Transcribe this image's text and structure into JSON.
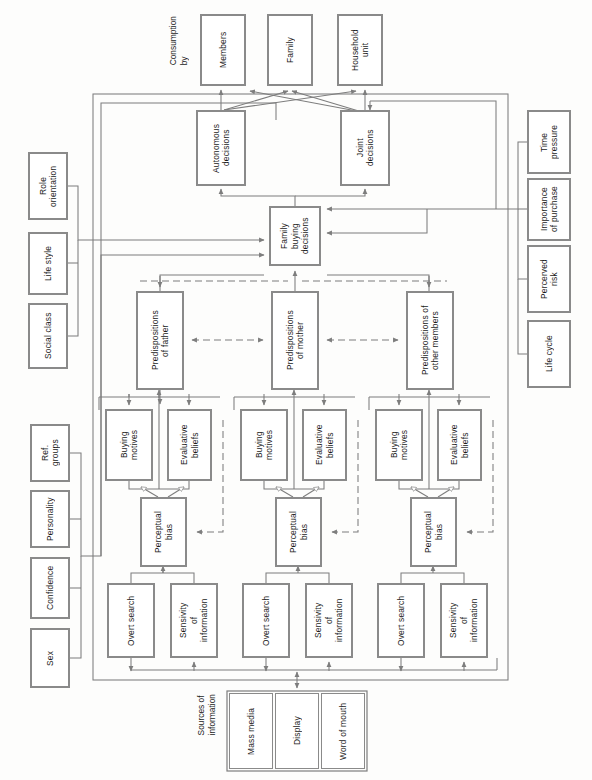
{
  "diagram": {
    "orientation": "rotated-90-ccw",
    "colors": {
      "box_border": "#8a8a8a",
      "box_fill": "#ffffff",
      "line": "#7d7d7d",
      "text": "#1b1b1b",
      "background": "#fdfdfc"
    },
    "free_labels": [
      {
        "id": "consumption-by",
        "text": "Consumption\nby",
        "x": 168,
        "y": 16
      },
      {
        "id": "sources-of-information",
        "text": "Sources of\ninformation",
        "x": 196,
        "y": 694
      }
    ],
    "boxes": [
      {
        "id": "members",
        "text": "Members",
        "x": 200,
        "y": 14,
        "w": 46,
        "h": 72
      },
      {
        "id": "family",
        "text": "Family",
        "x": 267,
        "y": 14,
        "w": 46,
        "h": 72
      },
      {
        "id": "household-unit",
        "text": "Household\nunit",
        "x": 337,
        "y": 14,
        "w": 46,
        "h": 72
      },
      {
        "id": "autonomous-decisions",
        "text": "Autonomous\ndecisions",
        "x": 196,
        "y": 110,
        "w": 50,
        "h": 76
      },
      {
        "id": "joint-decisions",
        "text": "Joint\ndecisions",
        "x": 340,
        "y": 110,
        "w": 50,
        "h": 76
      },
      {
        "id": "family-buying-decisions",
        "text": "Family\nbuying\ndecisions",
        "x": 269,
        "y": 206,
        "w": 52,
        "h": 60
      },
      {
        "id": "predispositions-father",
        "text": "Predispositions\nof father",
        "x": 136,
        "y": 291,
        "w": 48,
        "h": 99
      },
      {
        "id": "predispositions-mother",
        "text": "Predispositions\nof mother",
        "x": 271,
        "y": 291,
        "w": 48,
        "h": 99
      },
      {
        "id": "predispositions-other-members",
        "text": "Predispositions of\nother members",
        "x": 406,
        "y": 291,
        "w": 48,
        "h": 99
      },
      {
        "id": "buying-motives-father",
        "text": "Buying\nmotives",
        "x": 105,
        "y": 409,
        "w": 48,
        "h": 72
      },
      {
        "id": "evaluative-beliefs-father",
        "text": "Evaluative\nbeliefs",
        "x": 167,
        "y": 409,
        "w": 45,
        "h": 72
      },
      {
        "id": "perceptual-bias-father",
        "text": "Perceptual\nbias",
        "x": 140,
        "y": 497,
        "w": 47,
        "h": 70
      },
      {
        "id": "overt-search-father",
        "text": "Overt search",
        "x": 107,
        "y": 583,
        "w": 48,
        "h": 75
      },
      {
        "id": "sensivity-information-father",
        "text": "Sensivity\nof\ninformation",
        "x": 170,
        "y": 583,
        "w": 48,
        "h": 75
      },
      {
        "id": "buying-motives-mother",
        "text": "Buying\nmotives",
        "x": 240,
        "y": 409,
        "w": 48,
        "h": 72
      },
      {
        "id": "evaluative-beliefs-mother",
        "text": "Evaluative\nbeliefs",
        "x": 302,
        "y": 409,
        "w": 45,
        "h": 72
      },
      {
        "id": "perceptual-bias-mother",
        "text": "Perceptual\nbias",
        "x": 275,
        "y": 497,
        "w": 47,
        "h": 70
      },
      {
        "id": "overt-search-mother",
        "text": "Overt search",
        "x": 242,
        "y": 583,
        "w": 48,
        "h": 75
      },
      {
        "id": "sensivity-information-mother",
        "text": "Sensivity\nof\ninformation",
        "x": 305,
        "y": 583,
        "w": 48,
        "h": 75
      },
      {
        "id": "buying-motives-other",
        "text": "Buying\nmotives",
        "x": 375,
        "y": 409,
        "w": 48,
        "h": 72
      },
      {
        "id": "evaluative-beliefs-other",
        "text": "Evaluative\nbeliefs",
        "x": 437,
        "y": 409,
        "w": 45,
        "h": 72
      },
      {
        "id": "perceptual-bias-other",
        "text": "Perceptual\nbias",
        "x": 410,
        "y": 497,
        "w": 47,
        "h": 70
      },
      {
        "id": "overt-search-other",
        "text": "Overt search",
        "x": 377,
        "y": 583,
        "w": 48,
        "h": 75
      },
      {
        "id": "sensivity-information-other",
        "text": "Sensivity\nof\ninformation",
        "x": 440,
        "y": 583,
        "w": 48,
        "h": 75
      },
      {
        "id": "role-orientation",
        "text": "Role\norientation",
        "x": 28,
        "y": 152,
        "w": 40,
        "h": 68
      },
      {
        "id": "life-style",
        "text": "Life style",
        "x": 28,
        "y": 232,
        "w": 40,
        "h": 63
      },
      {
        "id": "social-class",
        "text": "Social class",
        "x": 28,
        "y": 303,
        "w": 40,
        "h": 66
      },
      {
        "id": "ref-groups",
        "text": "Ref.\ngroups",
        "x": 30,
        "y": 424,
        "w": 40,
        "h": 58
      },
      {
        "id": "personality",
        "text": "Personality",
        "x": 30,
        "y": 490,
        "w": 40,
        "h": 58
      },
      {
        "id": "confidence",
        "text": "Confidence",
        "x": 30,
        "y": 557,
        "w": 40,
        "h": 62
      },
      {
        "id": "sex",
        "text": "Sex",
        "x": 30,
        "y": 628,
        "w": 40,
        "h": 60
      },
      {
        "id": "time-pressure",
        "text": "Time\npressure",
        "x": 527,
        "y": 110,
        "w": 44,
        "h": 64
      },
      {
        "id": "importance-of-purchase",
        "text": "Importance\nof purchase",
        "x": 527,
        "y": 178,
        "w": 44,
        "h": 63
      },
      {
        "id": "perceived-risk",
        "text": "Percerved\nrisk",
        "x": 527,
        "y": 245,
        "w": 44,
        "h": 68
      },
      {
        "id": "life-cycle",
        "text": "Life cycle",
        "x": 527,
        "y": 320,
        "w": 44,
        "h": 68
      }
    ],
    "source_cells": [
      {
        "id": "mass-media",
        "text": "Mass media",
        "x": 229,
        "y": 693,
        "w": 44,
        "h": 76
      },
      {
        "id": "display",
        "text": "Display",
        "x": 275,
        "y": 693,
        "w": 44,
        "h": 76
      },
      {
        "id": "word-of-mouth",
        "text": "Word of mouth",
        "x": 321,
        "y": 693,
        "w": 44,
        "h": 76
      }
    ],
    "groups": [
      {
        "id": "system-boundary",
        "x": 93,
        "y": 94,
        "w": 415,
        "h": 586
      },
      {
        "id": "sources-boundary",
        "x": 227,
        "y": 691,
        "w": 140,
        "h": 80
      }
    ]
  }
}
